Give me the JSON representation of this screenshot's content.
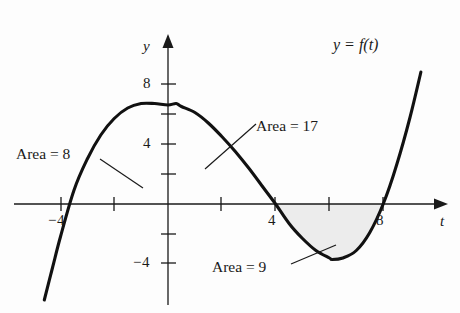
{
  "figure": {
    "type": "math-graph",
    "background_color": "#fdfdfd",
    "ink_color": "#1a1a1a",
    "shade_color": "#ebebeb"
  },
  "axes": {
    "x_axis_name": "t",
    "y_axis_name": "y",
    "x_tick_labels": [
      "−4",
      "4",
      "8"
    ],
    "y_tick_labels": [
      "8",
      "4",
      "−4"
    ],
    "x_ticks_values": [
      -4,
      -2,
      2,
      4,
      6,
      8
    ],
    "y_ticks_values": [
      8,
      6,
      4,
      2,
      -2,
      -4
    ],
    "x_range": [
      -6.2,
      10.8
    ],
    "y_range": [
      -6.5,
      9.5
    ],
    "origin_px": [
      168,
      204
    ],
    "px_per_unit_x": 26.9,
    "px_per_unit_y": 15.0
  },
  "curve": {
    "label": "y = f(t)",
    "roots": [
      -4,
      4,
      8
    ],
    "peak": {
      "t": 0.3,
      "y": 6.7
    },
    "trough": {
      "t": 6.1,
      "y": -3.7
    }
  },
  "annotations": [
    {
      "name": "area-8",
      "text": "Area = 8"
    },
    {
      "name": "area-17",
      "text": "Area = 17"
    },
    {
      "name": "area-9",
      "text": "Area = 9"
    }
  ],
  "chart_data": {
    "type": "line",
    "title": "",
    "xlabel": "t",
    "ylabel": "y",
    "xlim": [
      -6.2,
      10.8
    ],
    "ylim": [
      -6.5,
      9.5
    ],
    "grid": false,
    "legend": "none",
    "series": [
      {
        "name": "y = f(t)",
        "x": [
          -4.6,
          -4.3,
          -4.0,
          -3.5,
          -3.0,
          -2.5,
          -2.0,
          -1.5,
          -1.0,
          -0.5,
          0.0,
          0.3,
          0.5,
          1.0,
          1.5,
          2.0,
          2.5,
          3.0,
          3.5,
          4.0,
          4.5,
          5.0,
          5.5,
          6.0,
          6.1,
          6.5,
          7.0,
          7.5,
          8.0,
          8.5,
          9.0,
          9.4
        ],
        "y": [
          -6.4,
          -4.3,
          -2.2,
          0.9,
          3.0,
          4.6,
          5.7,
          6.4,
          6.7,
          6.7,
          6.6,
          6.7,
          6.5,
          6.1,
          5.4,
          4.5,
          3.5,
          2.4,
          1.2,
          0.0,
          -1.3,
          -2.3,
          -3.1,
          -3.6,
          -3.7,
          -3.6,
          -3.1,
          -1.9,
          0.0,
          2.6,
          5.8,
          8.8
        ]
      }
    ],
    "shaded_regions": [
      {
        "label": "Area = 8",
        "t_from": -4,
        "t_to": 0,
        "value": 8,
        "side": "above-axis"
      },
      {
        "label": "Area = 17",
        "t_from": 0,
        "t_to": 4,
        "value": 17,
        "side": "above-axis"
      },
      {
        "label": "Area = 9",
        "t_from": 4,
        "t_to": 8,
        "value": 9,
        "side": "below-axis",
        "filled": true
      }
    ],
    "annotations": [
      {
        "text": "Area = 8",
        "points_to": [
          -2.1,
          1.2
        ]
      },
      {
        "text": "Area = 17",
        "points_to": [
          1.6,
          2.4
        ]
      },
      {
        "text": "Area = 9",
        "points_to": [
          6.2,
          -2.9
        ]
      },
      {
        "text": "y = f(t)",
        "points_to": [
          9.0,
          6.0
        ]
      }
    ]
  }
}
